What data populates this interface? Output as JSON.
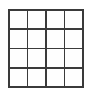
{
  "figure": {
    "type": "grid",
    "rows": 4,
    "columns": 4,
    "cell_count": 16,
    "line_color": "#3a3a3a",
    "cell_color": "#fefefe",
    "background_color": "#ffffff",
    "line_width_px": 1.6,
    "grid_left_px": 8,
    "grid_top_px": 9,
    "grid_width_px": 76,
    "grid_height_px": 79,
    "vertical_line_positions_px": [
      8,
      27,
      46,
      65,
      84
    ],
    "horizontal_line_positions_px": [
      9,
      29,
      49,
      69,
      88
    ],
    "cells": [
      {
        "row": 1,
        "col": 1,
        "label": ""
      },
      {
        "row": 1,
        "col": 2,
        "label": ""
      },
      {
        "row": 1,
        "col": 3,
        "label": ""
      },
      {
        "row": 1,
        "col": 4,
        "label": ""
      },
      {
        "row": 2,
        "col": 1,
        "label": ""
      },
      {
        "row": 2,
        "col": 2,
        "label": ""
      },
      {
        "row": 2,
        "col": 3,
        "label": ""
      },
      {
        "row": 2,
        "col": 4,
        "label": ""
      },
      {
        "row": 3,
        "col": 1,
        "label": ""
      },
      {
        "row": 3,
        "col": 2,
        "label": ""
      },
      {
        "row": 3,
        "col": 3,
        "label": ""
      },
      {
        "row": 3,
        "col": 4,
        "label": ""
      },
      {
        "row": 4,
        "col": 1,
        "label": ""
      },
      {
        "row": 4,
        "col": 2,
        "label": ""
      },
      {
        "row": 4,
        "col": 3,
        "label": ""
      },
      {
        "row": 4,
        "col": 4,
        "label": ""
      }
    ]
  }
}
